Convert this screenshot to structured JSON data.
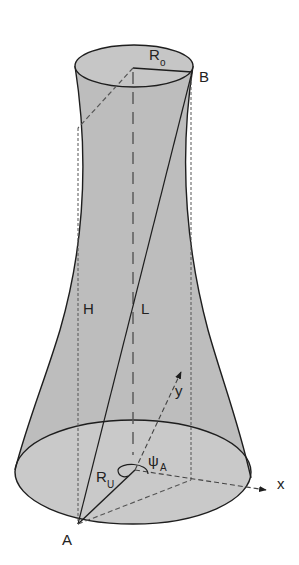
{
  "diagram": {
    "title": "",
    "shape": "hyperboloid-tower",
    "colors": {
      "fill": "#bdbdbd",
      "fill_base": "#c8c8c8",
      "stroke": "#1e1e1e",
      "dashed": "#555555",
      "background": "#ffffff"
    },
    "labels": {
      "top_radius": "R",
      "top_radius_sub": "o",
      "point_b": "B",
      "height": "H",
      "length": "L",
      "y_axis": "y",
      "x_axis": "x",
      "angle": "ψ",
      "angle_sub": "A",
      "bottom_radius": "R",
      "bottom_radius_sub": "U",
      "point_a": "A"
    }
  }
}
